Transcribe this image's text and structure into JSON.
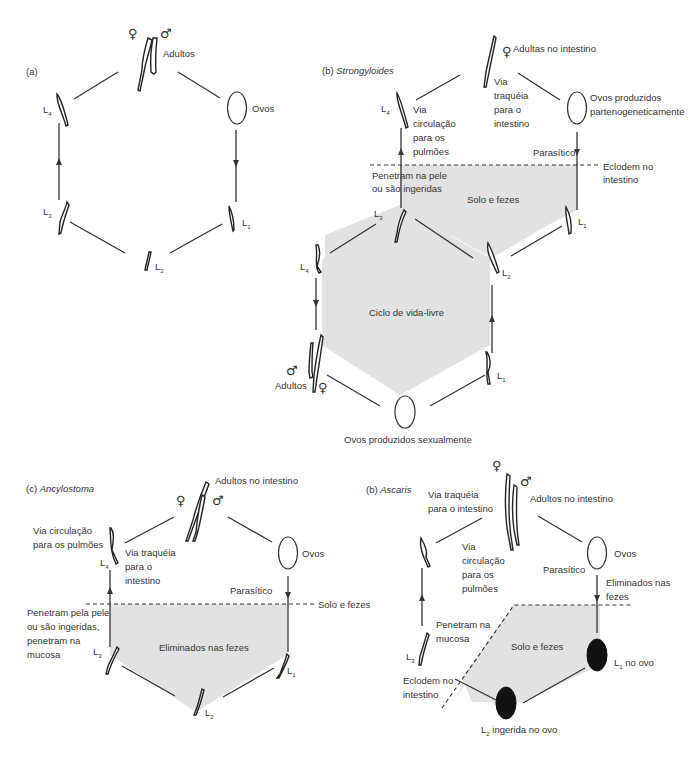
{
  "panels": {
    "a": {
      "label": "(a)",
      "adults": "Adultos",
      "eggs": "Ovos",
      "female_symbol": "♀",
      "male_symbol": "♂",
      "stages": [
        "L",
        "L",
        "L",
        "L"
      ],
      "stage_subs": [
        "1",
        "2",
        "3",
        "4"
      ]
    },
    "b_strongyloides": {
      "label_prefix": "(b) ",
      "label_name": "Strongyloides",
      "adults_female": "Adultas no intestino",
      "female_symbol": "♀",
      "male_symbol": "♂",
      "via_traqueia": [
        "Via",
        "traquéia",
        "para o",
        "intestino"
      ],
      "via_circulacao": [
        "Via",
        "circulação",
        "para os",
        "pulmões"
      ],
      "eggs_parth": [
        "Ovos produzidos",
        "partenogeneticamente"
      ],
      "parasitico": "Parasítico",
      "eclodem": [
        "Eclodem no",
        "intestino"
      ],
      "penetram": [
        "Penetram na pele",
        "ou são ingeridas"
      ],
      "solo_fezes": "Solo e fezes",
      "free_cycle": "Ciclo de vida-livre",
      "adults": "Adultos",
      "eggs_sexual": "Ovos produzidos sexualmente",
      "stage": "L",
      "subs": {
        "l1": "1",
        "l2": "2",
        "l3": "3",
        "l4": "4"
      }
    },
    "c_ancylostoma": {
      "label_prefix": "(c) ",
      "label_name": "Ancylostoma",
      "adults": "Adultos no intestino",
      "female_symbol": "♀",
      "male_symbol": "♂",
      "via_circulacao": [
        "Via circulação",
        "para os pulmões"
      ],
      "via_traqueia": [
        "Via traquéia",
        "para o",
        "intestino"
      ],
      "eggs": "Ovos",
      "parasitico": "Parasítico",
      "solo_fezes": "Solo e fezes",
      "penetram": [
        "Penetram pela pele",
        "ou são ingeridas,",
        "penetram na",
        "mucosa"
      ],
      "eliminados": "Eliminados nas fezes",
      "stage": "L",
      "subs": {
        "l1": "1",
        "l2": "2",
        "l3": "3",
        "l4": "4"
      }
    },
    "d_ascaris": {
      "label_prefix": "(b) ",
      "label_name": "Ascaris",
      "via_traqueia": [
        "Via traquéia",
        "para o intestino"
      ],
      "adults": "Adultos no intestino",
      "female_symbol": "♀",
      "male_symbol": "♂",
      "via_circulacao": [
        "Via",
        "circulação",
        "para os",
        "pulmões"
      ],
      "eggs": "Ovos",
      "parasitico": "Parasítico",
      "eliminados": [
        "Eliminados nas",
        "fezes"
      ],
      "penetram": [
        "Penetram na",
        "mucosa"
      ],
      "solo_fezes": "Solo e fezes",
      "eclodem": [
        "Eclodem no",
        "intestino"
      ],
      "l1_egg": " no ovo",
      "l2_egg": " ingerida no ovo",
      "stage": "L",
      "subs": {
        "l1": "1",
        "l2": "2",
        "l3": "3"
      }
    }
  },
  "colors": {
    "shade": "#e2e2e2",
    "line": "#333333",
    "egg_dark": "#111111"
  }
}
